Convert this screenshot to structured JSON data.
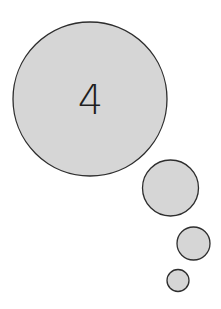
{
  "thought_bubble": {
    "text": "4",
    "fill_color": "#d6d6d6",
    "stroke_color": "#2e2e2e",
    "circles": [
      {
        "name": "main",
        "cx": 90,
        "cy": 99,
        "r": 77
      },
      {
        "name": "medium",
        "cx": 170.5,
        "cy": 188,
        "r": 28
      },
      {
        "name": "small",
        "cx": 193.5,
        "cy": 243.5,
        "r": 16.5
      },
      {
        "name": "tiny",
        "cx": 178,
        "cy": 280.5,
        "r": 11
      }
    ]
  }
}
